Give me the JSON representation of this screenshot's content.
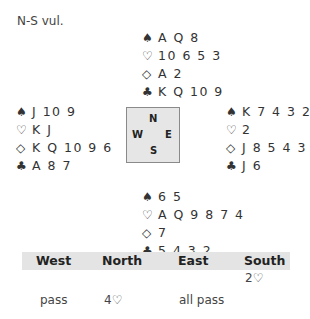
{
  "vulnerability": "N-S vul.",
  "suit_symbols": {
    "spades": "♠",
    "hearts": "♡",
    "diamonds": "◇",
    "clubs": "♣"
  },
  "hands": {
    "north": {
      "spades": "A Q 8",
      "hearts": "10 6 5 3",
      "diamonds": "A 2",
      "clubs": "K Q 10 9"
    },
    "west": {
      "spades": "J 10 9",
      "hearts": "K J",
      "diamonds": "K Q 10 9 6",
      "clubs": "A 8 7"
    },
    "east": {
      "spades": "K 7 4 3 2",
      "hearts": "2",
      "diamonds": "J 8 5 4 3",
      "clubs": "J 6"
    },
    "south": {
      "spades": "6 5",
      "hearts": "A Q 9 8 7 4",
      "diamonds": "7",
      "clubs": "5 4 3 2"
    }
  },
  "compass": {
    "n": "N",
    "s": "S",
    "w": "W",
    "e": "E"
  },
  "auction": {
    "headers": [
      "West",
      "North",
      "East",
      "South"
    ],
    "rounds": [
      [
        "",
        "",
        "",
        "2♡"
      ],
      [
        "pass",
        "4♡",
        "all pass",
        ""
      ]
    ]
  }
}
